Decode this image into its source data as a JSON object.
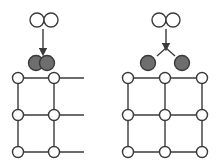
{
  "diagram": {
    "title": "",
    "panels": [
      {
        "id": "left",
        "description": "Molecule adsorbs as intact dimer on lattice",
        "incoming_pair": [
          {
            "x": 37,
            "y": 20
          },
          {
            "x": 51,
            "y": 20
          }
        ],
        "adsorbed_pair": [
          {
            "x": 36,
            "y": 63
          },
          {
            "x": 47,
            "y": 63
          }
        ],
        "arrow": {
          "x1": 43,
          "y1": 29,
          "x2": 43,
          "y2": 52
        },
        "lattice_nodes_x": [
          18,
          54
        ],
        "lattice_nodes_y": [
          78,
          115,
          152
        ],
        "open_edge_x": 84
      },
      {
        "id": "right",
        "description": "Molecule dissociates into two atoms on lattice",
        "incoming_pair": [
          {
            "x": 159,
            "y": 20
          },
          {
            "x": 173,
            "y": 20
          }
        ],
        "adsorbed_pair": [
          {
            "x": 148,
            "y": 63
          },
          {
            "x": 182,
            "y": 63
          }
        ],
        "arrow": {
          "x1": 166,
          "y1": 29,
          "x2": 166,
          "y2": 47
        },
        "split_ends": [
          {
            "x": 157,
            "y": 56
          },
          {
            "x": 175,
            "y": 56
          }
        ],
        "lattice_nodes_x": [
          128,
          165,
          202
        ],
        "lattice_nodes_y": [
          78,
          115,
          152
        ]
      }
    ],
    "colors": {
      "stroke": "#3a3a3a",
      "open_fill": "#ffffff",
      "adsorbed_fill": "#6e6e6e"
    }
  }
}
